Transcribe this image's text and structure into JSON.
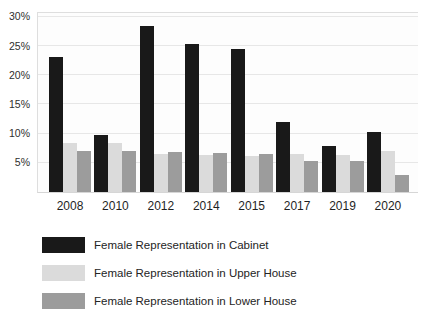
{
  "colors": {
    "cabinet": "#191919",
    "upper_house": "#dbdbdb",
    "lower_house": "#9c9c9c",
    "gridline": "#e7e7e7",
    "text": "#242424"
  },
  "chart_data": {
    "type": "bar",
    "title": "",
    "xlabel": "",
    "ylabel": "",
    "categories": [
      "2008",
      "2010",
      "2012",
      "2014",
      "2015",
      "2017",
      "2019",
      "2020"
    ],
    "series": [
      {
        "name": "Female Representation in Cabinet",
        "color": "#191919",
        "values": [
          23.2,
          9.8,
          28.5,
          25.4,
          24.5,
          12.0,
          7.9,
          10.2
        ]
      },
      {
        "name": "Female Representation in Upper House",
        "color": "#dbdbdb",
        "values": [
          8.4,
          8.4,
          6.5,
          6.3,
          6.2,
          6.5,
          6.4,
          7.1
        ]
      },
      {
        "name": "Female Representation in Lower House",
        "color": "#9c9c9c",
        "values": [
          7.0,
          7.0,
          6.9,
          6.7,
          6.6,
          5.4,
          5.4,
          2.9
        ]
      }
    ],
    "y_ticks": [
      "30%",
      "25%",
      "20%",
      "15%",
      "10%",
      "5%"
    ],
    "ylim": [
      0,
      31
    ],
    "grid": true,
    "legend_position": "bottom-left"
  }
}
